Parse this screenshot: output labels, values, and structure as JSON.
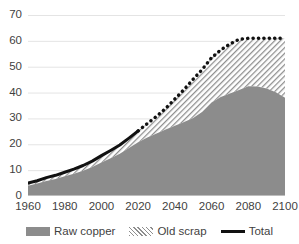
{
  "chart_data": {
    "type": "area",
    "title": "",
    "xlabel": "",
    "ylabel": "",
    "xlim": [
      1960,
      2100
    ],
    "ylim": [
      0,
      70
    ],
    "grid": true,
    "grid_axis": "y",
    "legend_position": "bottom",
    "stacked": true,
    "categories": [
      1960,
      1965,
      1970,
      1975,
      1980,
      1985,
      1990,
      1995,
      2000,
      2005,
      2010,
      2015,
      2020,
      2025,
      2030,
      2035,
      2040,
      2045,
      2050,
      2055,
      2060,
      2065,
      2070,
      2075,
      2080,
      2085,
      2090,
      2095,
      2100
    ],
    "x_ticks": [
      1960,
      1980,
      2000,
      2020,
      2040,
      2060,
      2080,
      2100
    ],
    "y_ticks": [
      0,
      10,
      20,
      30,
      40,
      50,
      60,
      70
    ],
    "series": [
      {
        "name": "Raw copper",
        "color": "#8c8c8c",
        "fill": "solid",
        "values": [
          4.0,
          4.8,
          5.8,
          6.6,
          7.6,
          8.6,
          9.8,
          11.2,
          13.0,
          14.6,
          16.3,
          18.6,
          20.8,
          22.6,
          24.2,
          25.7,
          27.2,
          28.6,
          30.2,
          32.6,
          36.2,
          38.3,
          39.6,
          41.0,
          42.4,
          42.3,
          41.6,
          40.1,
          38.0
        ]
      },
      {
        "name": "Old scrap",
        "color": "#8e8e8e",
        "fill": "diagonal-hatch",
        "values": [
          1.0,
          1.1,
          1.3,
          1.4,
          1.6,
          1.8,
          2.0,
          2.3,
          2.6,
          3.0,
          3.4,
          3.8,
          4.4,
          5.4,
          6.6,
          8.2,
          10.3,
          12.6,
          15.0,
          16.4,
          17.3,
          18.2,
          19.2,
          19.6,
          18.6,
          18.7,
          19.4,
          20.9,
          23.0
        ]
      }
    ],
    "total_line": {
      "name": "Total",
      "color": "#111111",
      "historical_style": "solid",
      "projection_style": "dotted",
      "split_year": 2020,
      "values": [
        5.0,
        5.9,
        7.1,
        8.0,
        9.2,
        10.4,
        11.8,
        13.5,
        15.6,
        17.6,
        19.7,
        22.4,
        25.2,
        28.0,
        30.8,
        33.9,
        37.5,
        41.2,
        45.2,
        49.0,
        53.5,
        56.5,
        58.8,
        60.6,
        61.0,
        61.0,
        61.0,
        61.0,
        61.0
      ]
    }
  },
  "axes": {
    "y_tick_labels": [
      "70",
      "60",
      "50",
      "40",
      "30",
      "20",
      "10",
      "0"
    ],
    "x_tick_labels": [
      "1960",
      "1980",
      "2000",
      "2020",
      "2040",
      "2060",
      "2080",
      "2100"
    ]
  },
  "legend": {
    "items": [
      {
        "label": "Raw copper",
        "swatch": "solid-gray-swatch"
      },
      {
        "label": "Old scrap",
        "swatch": "hatched-swatch"
      },
      {
        "label": "Total",
        "swatch": "black-line-swatch"
      }
    ]
  },
  "colors": {
    "raw_copper": "#8c8c8c",
    "old_scrap_hatch": "#8e8e8e",
    "total_line": "#111111",
    "gridline": "#e4e4e4",
    "axis_text": "#3f3f3f",
    "background": "#ffffff"
  }
}
